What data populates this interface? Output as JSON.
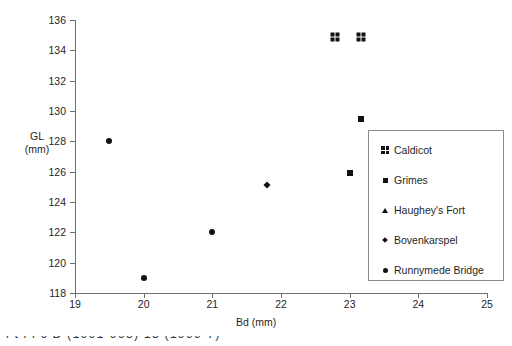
{
  "chart_data": {
    "type": "scatter",
    "title": "",
    "xlabel": "Bd (mm)",
    "ylabel": "GL (mm)",
    "ylabel_line1": "GL",
    "ylabel_line2": "(mm)",
    "xlim": [
      19,
      25
    ],
    "ylim": [
      118,
      136
    ],
    "xticks": [
      19,
      20,
      21,
      22,
      23,
      24,
      25
    ],
    "yticks": [
      118,
      120,
      122,
      124,
      126,
      128,
      130,
      132,
      134,
      136
    ],
    "xtick_labels": [
      "19",
      "20",
      "21",
      "22",
      "23",
      "24",
      "25"
    ],
    "ytick_labels": [
      "118",
      "120",
      "122",
      "124",
      "126",
      "128",
      "130",
      "132",
      "134",
      "136"
    ],
    "grid": false,
    "legend_position": "right-inside",
    "series": [
      {
        "name": "Caldicot",
        "marker": "grid4",
        "points": [
          {
            "x": 22.78,
            "y": 134.9
          },
          {
            "x": 23.17,
            "y": 134.9
          }
        ]
      },
      {
        "name": "Grimes",
        "marker": "square",
        "points": [
          {
            "x": 23.16,
            "y": 129.5
          },
          {
            "x": 23.0,
            "y": 125.9
          }
        ]
      },
      {
        "name": "Haughey's Fort",
        "marker": "triangle",
        "points": []
      },
      {
        "name": "Bovenkarspel",
        "marker": "diamond",
        "points": [
          {
            "x": 21.8,
            "y": 125.1
          }
        ]
      },
      {
        "name": "Runnymede Bridge",
        "marker": "circle",
        "points": [
          {
            "x": 19.5,
            "y": 128.0
          },
          {
            "x": 20.0,
            "y": 119.0
          },
          {
            "x": 21.0,
            "y": 122.0
          }
        ]
      }
    ]
  },
  "legend": {
    "items": [
      {
        "label": "Caldicot",
        "marker": "grid4"
      },
      {
        "label": "Grimes",
        "marker": "square"
      },
      {
        "label": "Haughey's Fort",
        "marker": "triangle"
      },
      {
        "label": "Bovenkarspel",
        "marker": "diamond"
      },
      {
        "label": "Runnymede Bridge",
        "marker": "circle"
      }
    ]
  },
  "page": {
    "caption_fragment": "l          t         l   i       ĉ    D      (1991-995)    15        (1999-7)"
  }
}
